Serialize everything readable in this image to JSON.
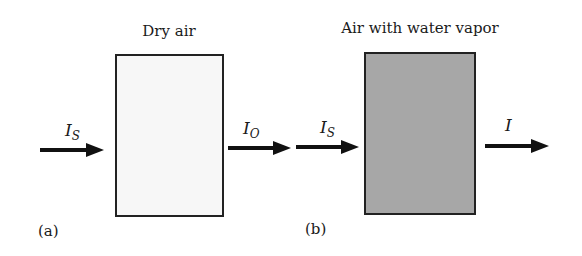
{
  "panels": [
    {
      "label": "(a)",
      "title": "Dry air",
      "box_fill": "#f7f7f7",
      "input": {
        "symbol": "I",
        "subscript": "S"
      },
      "output": {
        "symbol": "I",
        "subscript": "O"
      }
    },
    {
      "label": "(b)",
      "title": "Air with water vapor",
      "box_fill": "#a7a7a7",
      "input": {
        "symbol": "I",
        "subscript": "S"
      },
      "output": {
        "symbol": "I",
        "subscript": ""
      }
    }
  ]
}
